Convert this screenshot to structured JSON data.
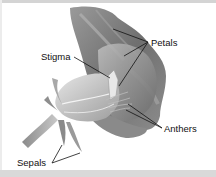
{
  "diagram": {
    "labels": [
      {
        "id": "petals",
        "text": "Petals"
      },
      {
        "id": "stigma",
        "text": "Stigma"
      },
      {
        "id": "anthers",
        "text": "Anthers"
      },
      {
        "id": "sepals",
        "text": "Sepals"
      }
    ],
    "colors": {
      "background": "#ffffff",
      "border": "#d6d6d6",
      "leader_line": "#111111",
      "petal_dark": "#7a7a7a",
      "petal_light": "#d0d0d0"
    }
  }
}
